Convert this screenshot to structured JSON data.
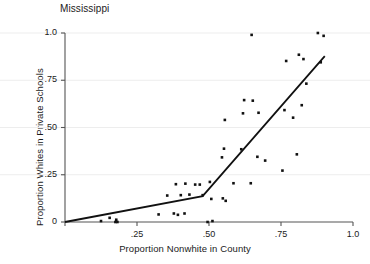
{
  "chart_data": {
    "type": "scatter",
    "title": "Mississippi",
    "xlabel": "Proportion Nonwhite in County",
    "ylabel": "Proportion  Whites in Private Schools",
    "xlim": [
      0,
      1.0
    ],
    "ylim": [
      0,
      1.0
    ],
    "grid": true,
    "grid_orientation": "horizontal",
    "legend": null,
    "xticks": [
      {
        "value": 0,
        "label": "0"
      },
      {
        "value": 0.25,
        "label": ".25"
      },
      {
        "value": 0.5,
        "label": ".50"
      },
      {
        "value": 0.75,
        "label": ".75"
      },
      {
        "value": 1.0,
        "label": "1.0"
      }
    ],
    "yticks": [
      {
        "value": 0,
        "label": "0"
      },
      {
        "value": 0.25,
        "label": ".25"
      },
      {
        "value": 0.5,
        "label": ".50"
      },
      {
        "value": 0.75,
        "label": ".75"
      },
      {
        "value": 1.0,
        "label": "1.0"
      }
    ],
    "marker_color": "#111111",
    "line_color": "#111111",
    "axis_color": "#555555",
    "points": [
      {
        "x": 0.125,
        "y": 0.005
      },
      {
        "x": 0.155,
        "y": 0.022
      },
      {
        "x": 0.175,
        "y": 0.0
      },
      {
        "x": 0.178,
        "y": 0.012
      },
      {
        "x": 0.182,
        "y": 0.0
      },
      {
        "x": 0.325,
        "y": 0.04
      },
      {
        "x": 0.355,
        "y": 0.14
      },
      {
        "x": 0.378,
        "y": 0.045
      },
      {
        "x": 0.385,
        "y": 0.2
      },
      {
        "x": 0.392,
        "y": 0.038
      },
      {
        "x": 0.402,
        "y": 0.142
      },
      {
        "x": 0.415,
        "y": 0.045
      },
      {
        "x": 0.418,
        "y": 0.203
      },
      {
        "x": 0.432,
        "y": 0.145
      },
      {
        "x": 0.452,
        "y": 0.198
      },
      {
        "x": 0.468,
        "y": 0.198
      },
      {
        "x": 0.478,
        "y": 0.142
      },
      {
        "x": 0.495,
        "y": 0.0
      },
      {
        "x": 0.503,
        "y": 0.212
      },
      {
        "x": 0.508,
        "y": 0.122
      },
      {
        "x": 0.512,
        "y": 0.005
      },
      {
        "x": 0.545,
        "y": 0.342
      },
      {
        "x": 0.548,
        "y": 0.125
      },
      {
        "x": 0.552,
        "y": 0.388
      },
      {
        "x": 0.555,
        "y": 0.54
      },
      {
        "x": 0.558,
        "y": 0.112
      },
      {
        "x": 0.585,
        "y": 0.205
      },
      {
        "x": 0.612,
        "y": 0.385
      },
      {
        "x": 0.618,
        "y": 0.575
      },
      {
        "x": 0.622,
        "y": 0.645
      },
      {
        "x": 0.645,
        "y": 0.205
      },
      {
        "x": 0.648,
        "y": 0.99
      },
      {
        "x": 0.652,
        "y": 0.642
      },
      {
        "x": 0.668,
        "y": 0.345
      },
      {
        "x": 0.672,
        "y": 0.578
      },
      {
        "x": 0.695,
        "y": 0.325
      },
      {
        "x": 0.755,
        "y": 0.272
      },
      {
        "x": 0.762,
        "y": 0.592
      },
      {
        "x": 0.768,
        "y": 0.852
      },
      {
        "x": 0.792,
        "y": 0.552
      },
      {
        "x": 0.805,
        "y": 0.358
      },
      {
        "x": 0.812,
        "y": 0.885
      },
      {
        "x": 0.822,
        "y": 0.618
      },
      {
        "x": 0.828,
        "y": 0.862
      },
      {
        "x": 0.838,
        "y": 0.732
      },
      {
        "x": 0.878,
        "y": 1.0
      },
      {
        "x": 0.888,
        "y": 0.845
      },
      {
        "x": 0.898,
        "y": 0.985
      }
    ],
    "fit_line": {
      "type": "piecewise-linear",
      "vertices": [
        {
          "x": 0.0,
          "y": 0.0
        },
        {
          "x": 0.478,
          "y": 0.137
        },
        {
          "x": 0.902,
          "y": 0.878
        }
      ]
    }
  }
}
